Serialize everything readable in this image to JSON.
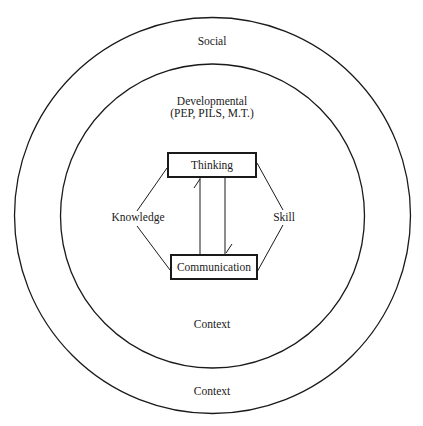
{
  "diagram": {
    "outer_circle": {
      "label": "Social",
      "bottom_label": "Context"
    },
    "inner_circle": {
      "label_line1": "Developmental",
      "label_line2": "(PEP, PILS, M.T.)",
      "bottom_label": "Context"
    },
    "nodes": {
      "top": "Thinking",
      "bottom": "Communication",
      "left": "Knowledge",
      "right": "Skill"
    },
    "colors": {
      "stroke": "#1a1a1a",
      "background": "#ffffff"
    }
  }
}
